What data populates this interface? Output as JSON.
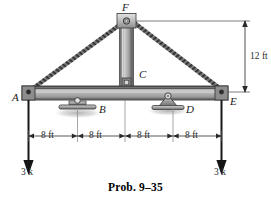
{
  "figure": {
    "caption": "Prob. 9–35",
    "type": "truss-structure-diagram",
    "joints": [
      {
        "id": "A",
        "label": "A",
        "role": "left-beam-end-pin"
      },
      {
        "id": "B",
        "label": "B",
        "role": "rocker-support"
      },
      {
        "id": "C",
        "label": "C",
        "role": "column-base-joint"
      },
      {
        "id": "D",
        "label": "D",
        "role": "pin-support"
      },
      {
        "id": "E",
        "label": "E",
        "role": "right-beam-end-pin"
      },
      {
        "id": "F",
        "label": "F",
        "role": "top-apex-joint"
      }
    ],
    "dimensions": {
      "height_label": "12 ft",
      "spans": [
        "8 ft",
        "8 ft",
        "8 ft",
        "8 ft"
      ]
    },
    "loads": [
      {
        "id": "left",
        "label": "3 k",
        "direction": "down"
      },
      {
        "id": "right",
        "label": "3 k",
        "direction": "down"
      }
    ],
    "colors": {
      "member_dark": "#4a4a4a",
      "member_light": "#d6d6d6",
      "line": "#1a1a1a",
      "dim_line": "#5a5a5a",
      "background": "#ffffff"
    }
  }
}
